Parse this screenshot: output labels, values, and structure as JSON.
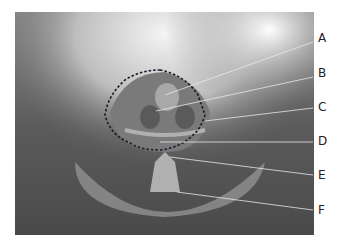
{
  "figure": {
    "type": "radiograph",
    "outline_style": "dashed",
    "labels": [
      {
        "letter": "A",
        "y": 38
      },
      {
        "letter": "B",
        "y": 73
      },
      {
        "letter": "C",
        "y": 107
      },
      {
        "letter": "D",
        "y": 141
      },
      {
        "letter": "E",
        "y": 174
      },
      {
        "letter": "F",
        "y": 210
      }
    ]
  }
}
